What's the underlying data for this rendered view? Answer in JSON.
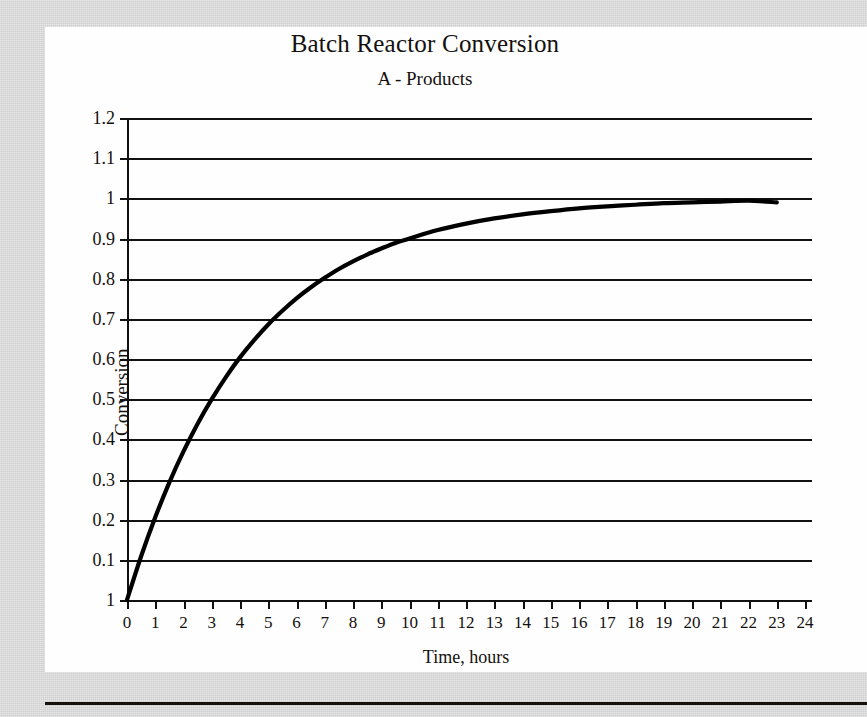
{
  "figure": {
    "title": "Batch Reactor Conversion",
    "subtitle": "A - Products"
  },
  "colors": {
    "page_background": "#d2d2d2",
    "figure_background": "#fefefe",
    "ink": "#111111",
    "curve": "#000000"
  },
  "chart_data": {
    "type": "line",
    "title": "Batch Reactor Conversion",
    "subtitle": "A - Products",
    "xlabel": "Time, hours",
    "ylabel": "Conversion",
    "xlim": [
      0,
      24
    ],
    "ylim": [
      0,
      1.2
    ],
    "grid": true,
    "legend": "none",
    "xticks": [
      0,
      1,
      2,
      3,
      4,
      5,
      6,
      7,
      8,
      9,
      10,
      11,
      12,
      13,
      14,
      15,
      16,
      17,
      18,
      19,
      20,
      21,
      22,
      23,
      24
    ],
    "xtick_labels": [
      "0",
      "1",
      "2",
      "3",
      "4",
      "5",
      "6",
      "7",
      "8",
      "9",
      "10",
      "11",
      "12",
      "13",
      "14",
      "15",
      "16",
      "17",
      "18",
      "19",
      "20",
      "21",
      "22",
      "23",
      "24"
    ],
    "yticks": [
      1.2,
      1.1,
      1.0,
      0.9,
      0.8,
      0.7,
      0.6,
      0.5,
      0.4,
      0.3,
      0.2,
      0.1,
      0.0
    ],
    "ytick_labels": [
      "1.2",
      "1.1",
      "1",
      "0.9",
      "0.8",
      "0.7",
      "0.6",
      "0.5",
      "0.4",
      "0.3",
      "0.2",
      "0.1",
      "1"
    ],
    "series": [
      {
        "name": "Conversion",
        "x": [
          0,
          0.5,
          1,
          1.5,
          2,
          2.5,
          3,
          3.5,
          4,
          4.5,
          5,
          5.5,
          6,
          6.5,
          7,
          7.5,
          8,
          8.5,
          9,
          9.5,
          10,
          11,
          12,
          13,
          14,
          15,
          16,
          17,
          18,
          19,
          20,
          21,
          22,
          23
        ],
        "y": [
          0,
          0.109,
          0.206,
          0.293,
          0.37,
          0.439,
          0.5,
          0.555,
          0.604,
          0.647,
          0.686,
          0.72,
          0.751,
          0.778,
          0.802,
          0.824,
          0.843,
          0.86,
          0.875,
          0.889,
          0.9,
          0.921,
          0.937,
          0.95,
          0.96,
          0.968,
          0.975,
          0.98,
          0.984,
          0.988,
          0.99,
          0.992,
          0.994,
          0.99
        ]
      }
    ]
  }
}
